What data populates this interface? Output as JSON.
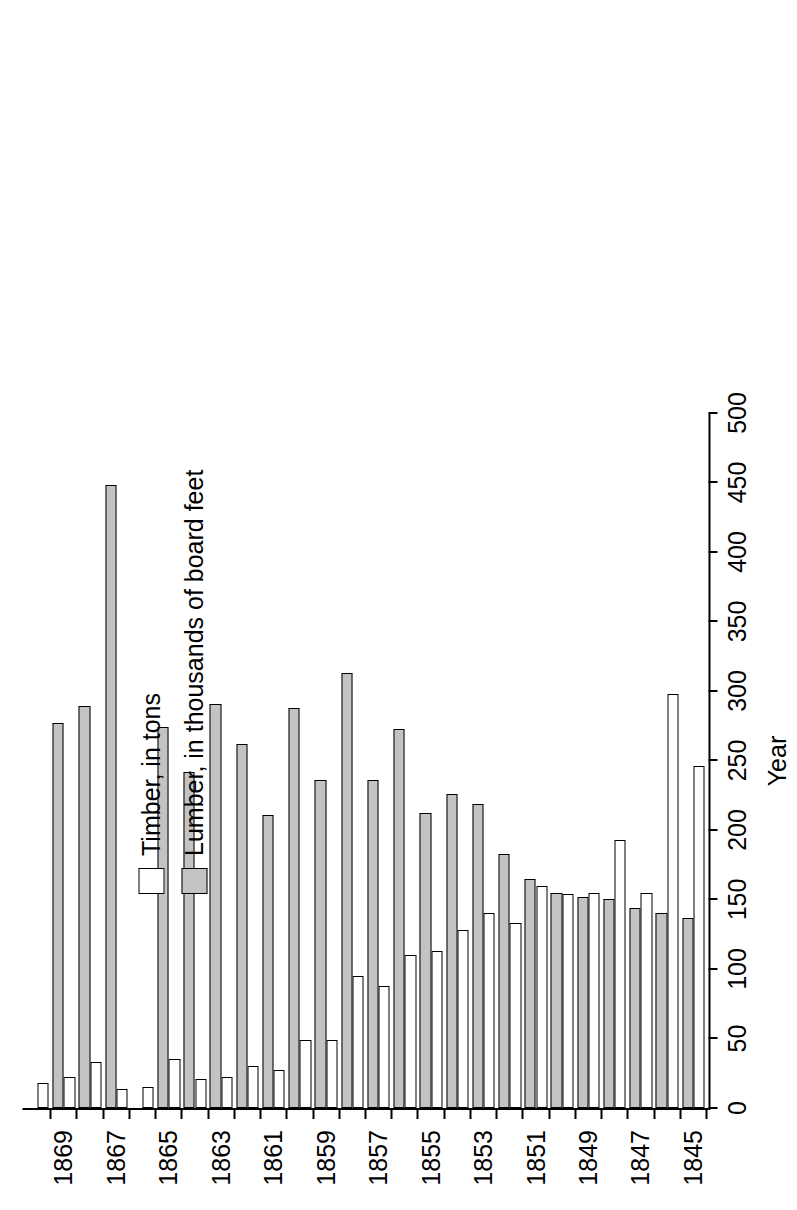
{
  "chart_data": {
    "type": "bar",
    "orientation": "horizontal",
    "title": "",
    "xlabel": "Year",
    "ylabel": "",
    "value_axis_label": "",
    "ylim": [
      0,
      500
    ],
    "tick_step": 50,
    "grid": false,
    "legend_position": "upper-left",
    "value_ticks": [
      "0",
      "50",
      "100",
      "150",
      "200",
      "250",
      "300",
      "350",
      "400",
      "450",
      "500"
    ],
    "categories": [
      "1845",
      "1846",
      "1847",
      "1848",
      "1849",
      "1850",
      "1851",
      "1852",
      "1853",
      "1854",
      "1855",
      "1856",
      "1857",
      "1858",
      "1859",
      "1860",
      "1861",
      "1862",
      "1863",
      "1864",
      "1865",
      "1866",
      "1867",
      "1868",
      "1869",
      "1870"
    ],
    "category_tick_labels": [
      "1845",
      "1847",
      "1849",
      "1851",
      "1853",
      "1855",
      "1857",
      "1859",
      "1861",
      "1863",
      "1865",
      "1867",
      "1869"
    ],
    "series": [
      {
        "name": "Timber, in tons",
        "color": "#ffffff",
        "values": [
          246,
          298,
          155,
          193,
          155,
          154,
          160,
          133,
          140,
          128,
          113,
          110,
          88,
          95,
          49,
          49,
          27,
          30,
          22,
          21,
          35,
          15,
          14,
          33,
          22,
          18
        ]
      },
      {
        "name": "Lumber, in thousands of board feet",
        "color": "#c3c3c3",
        "values": [
          137,
          140,
          144,
          150,
          152,
          155,
          165,
          183,
          219,
          226,
          212,
          273,
          236,
          313,
          236,
          288,
          211,
          262,
          291,
          242,
          274,
          0,
          448,
          289,
          277,
          0
        ]
      }
    ]
  },
  "legend": {
    "items": [
      {
        "label": "Timber, in tons",
        "swatch": "white-square-swatch"
      },
      {
        "label": "Lumber, in thousands of board feet",
        "swatch": "gray-square-swatch"
      }
    ]
  },
  "axes": {
    "category_axis_title": "Year"
  }
}
